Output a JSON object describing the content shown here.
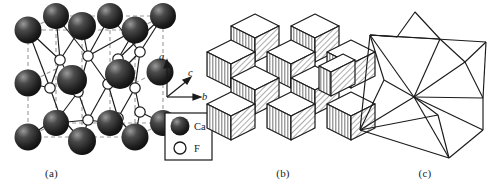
{
  "figure": {
    "background_color": "#ffffff",
    "panels": [
      {
        "id": "a",
        "caption": "(a)",
        "description": "Ball-and-stick unit cell of fluorite showing Ca and F atoms with dashed unit-cell edges"
      },
      {
        "id": "b",
        "caption": "(b)",
        "description": "Cube packing representation of the coordination cubes"
      },
      {
        "id": "c",
        "caption": "(c)",
        "description": "Wireframe polyhedral representation of corner-sharing tetrahedra"
      }
    ]
  },
  "legend": {
    "box_color": "#1a1a1a",
    "entries": [
      {
        "symbol": "Ca",
        "marker": "filled-sphere",
        "color": "#262626"
      },
      {
        "symbol": "F",
        "marker": "open-circle",
        "color": "#ffffff"
      }
    ]
  },
  "axes": {
    "labels": {
      "a": "a",
      "b": "b",
      "c": "c"
    },
    "directions": {
      "a": "up",
      "b": "right",
      "c": "diagonal-up-right"
    },
    "color": "#1a1a1a"
  },
  "colors": {
    "atom_ca": "#262626",
    "atom_ca_highlight": "#8c8c8c",
    "atom_f_fill": "#ffffff",
    "bond": "#1a1a1a",
    "cell_edge_dashed": "#9a9a9a",
    "cube_top": "#ffffff",
    "cube_front": "#d0d0d0",
    "cube_side": "#bdbdbd",
    "outline": "#1a1a1a"
  },
  "panel_a": {
    "ca_rows": [
      5,
      4,
      5
    ],
    "f_bands": [
      4,
      4
    ],
    "ca_atom_count": 14,
    "f_atom_count": 8
  },
  "panel_b": {
    "cube_count": 13,
    "top_face": "white",
    "front_face": "vertical-stripes",
    "side_face": "diagonal-hatch"
  },
  "panel_c": {
    "shape": "star-polyhedron-wireframe",
    "stroke": "#1a1a1a"
  }
}
